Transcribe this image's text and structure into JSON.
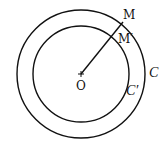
{
  "diagram": {
    "type": "concentric-circles",
    "center": {
      "label": "O",
      "x": 81,
      "y": 74
    },
    "outer_circle": {
      "label": "ℭ",
      "display_label": "C",
      "radius": 64
    },
    "inner_circle": {
      "label": "C'",
      "display_label": "C′",
      "radius": 48
    },
    "points": [
      {
        "label": "M",
        "on": "outer_circle"
      },
      {
        "label": "M′",
        "on": "inner_circle"
      }
    ],
    "segment": "OM",
    "colors": {
      "stroke": "#111111",
      "background": "#ffffff"
    }
  }
}
